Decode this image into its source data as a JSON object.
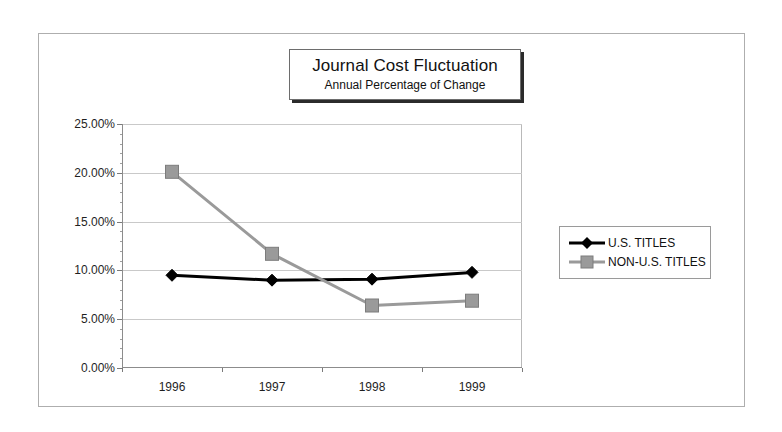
{
  "chart_data": {
    "type": "line",
    "title": "Journal Cost Fluctuation",
    "subtitle": "Annual Percentage of Change",
    "xlabel": "",
    "ylabel": "",
    "categories": [
      "1996",
      "1997",
      "1998",
      "1999"
    ],
    "series": [
      {
        "name": "U.S. TITLES",
        "marker": "diamond",
        "color": "#000000",
        "values": [
          9.5,
          9.0,
          9.1,
          9.8
        ]
      },
      {
        "name": "NON-U.S. TITLES",
        "marker": "square",
        "color": "#9a9a9a",
        "values": [
          20.1,
          11.7,
          6.4,
          6.9
        ]
      }
    ],
    "ylim": [
      0,
      25
    ],
    "ytick_labels": [
      "0.00%",
      "5.00%",
      "10.00%",
      "15.00%",
      "20.00%",
      "25.00%"
    ],
    "ytick_values": [
      0,
      5,
      10,
      15,
      20,
      25
    ],
    "grid": true,
    "legend_position": "right"
  },
  "legend": {
    "entries": [
      {
        "label": "U.S. TITLES"
      },
      {
        "label": "NON-U.S. TITLES"
      }
    ]
  }
}
